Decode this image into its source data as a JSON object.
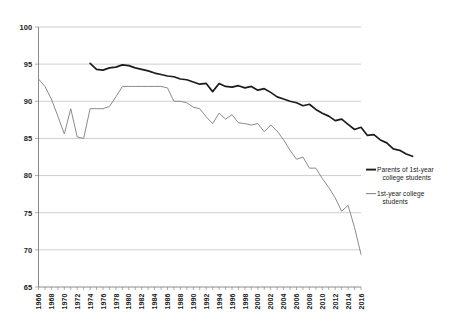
{
  "chart_data": {
    "type": "line",
    "title": "",
    "subtitle": "",
    "xlabel": "",
    "ylabel": "",
    "xlim": [
      1966,
      2016
    ],
    "ylim": [
      65,
      100
    ],
    "yticks": [
      65,
      70,
      75,
      80,
      85,
      90,
      95,
      100
    ],
    "grid": true,
    "legend_position": "right",
    "x": [
      1966,
      1967,
      1968,
      1969,
      1970,
      1971,
      1972,
      1973,
      1974,
      1975,
      1976,
      1977,
      1978,
      1979,
      1980,
      1981,
      1982,
      1983,
      1984,
      1985,
      1986,
      1987,
      1988,
      1989,
      1990,
      1991,
      1992,
      1993,
      1994,
      1995,
      1996,
      1997,
      1998,
      1999,
      2000,
      2001,
      2002,
      2003,
      2004,
      2005,
      2006,
      2007,
      2008,
      2009,
      2010,
      2011,
      2012,
      2013,
      2014,
      2015,
      2016
    ],
    "xtick_labels": [
      "1966",
      "1968",
      "1970",
      "1972",
      "1974",
      "1976",
      "1978",
      "1980",
      "1982",
      "1984",
      "1986",
      "1988",
      "1990",
      "1992",
      "1994",
      "1996",
      "1998",
      "2000",
      "2002",
      "2004",
      "2006",
      "2008",
      "2010",
      "2012",
      "2014",
      "2016"
    ],
    "series": [
      {
        "name": "Parents of 1st-year college students",
        "color": "#1c1c1c",
        "x_start": 1974,
        "values": [
          95.1,
          94.3,
          94.2,
          94.5,
          94.6,
          94.9,
          94.8,
          94.5,
          94.3,
          94.1,
          93.8,
          93.6,
          93.4,
          93.3,
          93.0,
          92.9,
          92.6,
          92.3,
          92.4,
          91.3,
          92.4,
          92.0,
          91.9,
          92.1,
          91.8,
          92.0,
          91.5,
          91.7,
          91.2,
          90.6,
          90.3,
          90.0,
          89.8,
          89.4,
          89.6,
          88.9,
          88.4,
          88.0,
          87.4,
          87.6,
          86.9,
          86.2,
          86.5,
          85.4,
          85.5,
          84.8,
          84.4,
          83.6,
          83.4,
          82.9,
          82.6
        ]
      },
      {
        "name": "1st-year college students",
        "color": "#8b8b8b",
        "x_start": 1966,
        "values": [
          93.0,
          92.0,
          90.3,
          88.0,
          85.6,
          89.0,
          85.2,
          85.0,
          89.0,
          89.0,
          89.0,
          89.3,
          90.6,
          92.0,
          92.0,
          92.0,
          92.0,
          92.0,
          92.0,
          92.0,
          91.8,
          90.0,
          90.0,
          89.8,
          89.2,
          89.0,
          87.9,
          87.0,
          88.4,
          87.6,
          88.2,
          87.1,
          87.0,
          86.8,
          87.0,
          85.9,
          86.8,
          86.0,
          84.8,
          83.4,
          82.2,
          82.5,
          81.0,
          81.0,
          79.6,
          78.4,
          77.0,
          75.2,
          76.0,
          73.0,
          69.4
        ]
      }
    ],
    "legend": [
      {
        "label_line1": "Parents of 1st-year",
        "label_line2": "college students",
        "color": "#1c1c1c",
        "weight": "thick"
      },
      {
        "label_line1": "1st-year college",
        "label_line2": "students",
        "color": "#8b8b8b",
        "weight": "thin"
      }
    ]
  }
}
